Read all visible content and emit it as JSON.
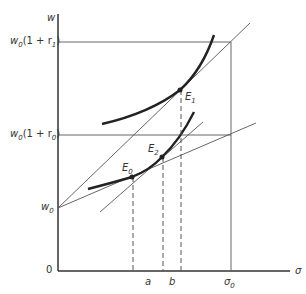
{
  "diagram": {
    "axis_labels": {
      "y": "w",
      "x": "σ",
      "origin": "0"
    },
    "y_ticks": [
      {
        "id": "w0_1_r1",
        "text": "w",
        "sub": "0",
        "rest": "(1 + r",
        "rsub": "1",
        "close": ")"
      },
      {
        "id": "w0_1_r0",
        "text": "w",
        "sub": "0",
        "rest": "(1 + r",
        "rsub": "0",
        "close": ")"
      },
      {
        "id": "w0",
        "text": "w",
        "sub": "0"
      }
    ],
    "x_ticks": [
      {
        "id": "a",
        "text": "a"
      },
      {
        "id": "b",
        "text": "b"
      },
      {
        "id": "sigma0",
        "text": "σ",
        "sub": "0"
      }
    ],
    "points": [
      {
        "id": "E1",
        "text": "E",
        "sub": "1"
      },
      {
        "id": "E0",
        "text": "E",
        "sub": "0"
      },
      {
        "id": "E2",
        "text": "E",
        "sub": "2"
      }
    ],
    "colors": {
      "line": "#555555",
      "curve": "#222222",
      "axis": "#333333"
    }
  }
}
